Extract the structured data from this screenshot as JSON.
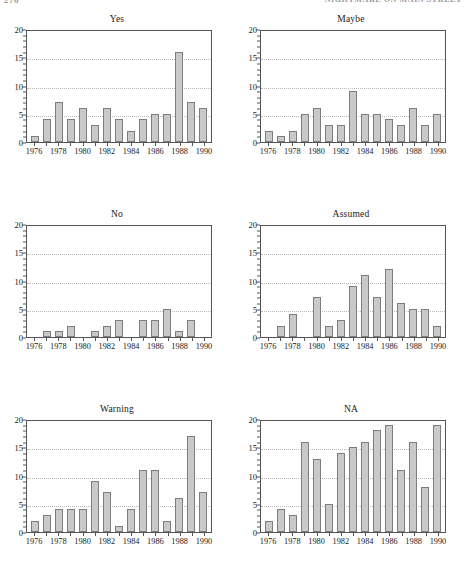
{
  "running_head": {
    "folio": "276",
    "title": "NIGHTMARE ON MAIN STREET"
  },
  "colors": {
    "bar_fill": "#c9c9c9",
    "bar_border": "#7d7d7d",
    "axis": "#555555",
    "gridline": "#b9b9b9",
    "text": "#1a1a1a"
  },
  "chart_data": [
    {
      "type": "bar",
      "title": "Yes",
      "xlabel": "",
      "ylabel": "",
      "x": [
        1976,
        1977,
        1978,
        1979,
        1980,
        1981,
        1982,
        1983,
        1984,
        1985,
        1986,
        1987,
        1988,
        1989,
        1990
      ],
      "values": [
        1,
        4,
        7,
        4,
        6,
        3,
        6,
        4,
        2,
        4,
        5,
        5,
        16,
        7,
        6
      ],
      "ylim": [
        0,
        20
      ],
      "yticks": [
        0,
        5,
        10,
        15,
        20
      ],
      "ytick_labels": [
        "0",
        "5",
        "10",
        "15",
        "20"
      ],
      "yminor_step": 1,
      "xtick_labels": [
        "1976",
        "1978",
        "1980",
        "1982",
        "1984",
        "1986",
        "1988",
        "1990"
      ],
      "xtick_years": [
        1976,
        1978,
        1980,
        1982,
        1984,
        1986,
        1988,
        1990
      ],
      "gridlines": [
        5,
        10,
        15
      ],
      "grid": true,
      "legend": "none"
    },
    {
      "type": "bar",
      "title": "Maybe",
      "xlabel": "",
      "ylabel": "",
      "x": [
        1976,
        1977,
        1978,
        1979,
        1980,
        1981,
        1982,
        1983,
        1984,
        1985,
        1986,
        1987,
        1988,
        1989,
        1990
      ],
      "values": [
        2,
        1,
        2,
        5,
        6,
        3,
        3,
        9,
        5,
        5,
        4,
        3,
        6,
        3,
        5
      ],
      "ylim": [
        0,
        20
      ],
      "yticks": [
        0,
        5,
        10,
        15,
        20
      ],
      "ytick_labels": [
        "0",
        "5",
        "10",
        "15",
        "20"
      ],
      "yminor_step": 1,
      "xtick_labels": [
        "1976",
        "1978",
        "1980",
        "1982",
        "1984",
        "1986",
        "1988",
        "1990"
      ],
      "xtick_years": [
        1976,
        1978,
        1980,
        1982,
        1984,
        1986,
        1988,
        1990
      ],
      "gridlines": [
        5,
        10,
        15
      ],
      "grid": true,
      "legend": "none"
    },
    {
      "type": "bar",
      "title": "No",
      "xlabel": "",
      "ylabel": "",
      "x": [
        1976,
        1977,
        1978,
        1979,
        1980,
        1981,
        1982,
        1983,
        1984,
        1985,
        1986,
        1987,
        1988,
        1989,
        1990
      ],
      "values": [
        0,
        1,
        1,
        2,
        0,
        1,
        2,
        3,
        0,
        3,
        3,
        5,
        1,
        3,
        0
      ],
      "ylim": [
        0,
        20
      ],
      "yticks": [
        0,
        5,
        10,
        15,
        20
      ],
      "ytick_labels": [
        "0",
        "5",
        "10",
        "15",
        "20"
      ],
      "yminor_step": 1,
      "xtick_labels": [
        "1976",
        "1978",
        "1980",
        "1982",
        "1984",
        "1986",
        "1988",
        "1990"
      ],
      "xtick_years": [
        1976,
        1978,
        1980,
        1982,
        1984,
        1986,
        1988,
        1990
      ],
      "gridlines": [
        5,
        10,
        15
      ],
      "grid": true,
      "legend": "none"
    },
    {
      "type": "bar",
      "title": "Assumed",
      "xlabel": "",
      "ylabel": "",
      "x": [
        1976,
        1977,
        1978,
        1979,
        1980,
        1981,
        1982,
        1983,
        1984,
        1985,
        1986,
        1987,
        1988,
        1989,
        1990
      ],
      "values": [
        0,
        2,
        4,
        0,
        7,
        2,
        3,
        9,
        11,
        7,
        12,
        6,
        5,
        5,
        2
      ],
      "ylim": [
        0,
        20
      ],
      "yticks": [
        0,
        5,
        10,
        15,
        20
      ],
      "ytick_labels": [
        "0",
        "5",
        "10",
        "15",
        "20"
      ],
      "yminor_step": 1,
      "xtick_labels": [
        "1976",
        "1978",
        "1980",
        "1982",
        "1984",
        "1986",
        "1988",
        "1990"
      ],
      "xtick_years": [
        1976,
        1978,
        1980,
        1982,
        1984,
        1986,
        1988,
        1990
      ],
      "gridlines": [
        5,
        10,
        15
      ],
      "grid": true,
      "legend": "none"
    },
    {
      "type": "bar",
      "title": "Warning",
      "xlabel": "",
      "ylabel": "",
      "x": [
        1976,
        1977,
        1978,
        1979,
        1980,
        1981,
        1982,
        1983,
        1984,
        1985,
        1986,
        1987,
        1988,
        1989,
        1990
      ],
      "values": [
        2,
        3,
        4,
        4,
        4,
        9,
        7,
        1,
        4,
        11,
        11,
        2,
        6,
        17,
        7
      ],
      "ylim": [
        0,
        20
      ],
      "yticks": [
        0,
        5,
        10,
        15,
        20
      ],
      "ytick_labels": [
        "0",
        "5",
        "10",
        "15",
        "20"
      ],
      "yminor_step": 1,
      "xtick_labels": [
        "1976",
        "1978",
        "1980",
        "1982",
        "1984",
        "1986",
        "1988",
        "1990"
      ],
      "xtick_years": [
        1976,
        1978,
        1980,
        1982,
        1984,
        1986,
        1988,
        1990
      ],
      "gridlines": [
        5,
        10,
        15
      ],
      "grid": true,
      "legend": "none"
    },
    {
      "type": "bar",
      "title": "NA",
      "xlabel": "",
      "ylabel": "",
      "x": [
        1976,
        1977,
        1978,
        1979,
        1980,
        1981,
        1982,
        1983,
        1984,
        1985,
        1986,
        1987,
        1988,
        1989,
        1990
      ],
      "values": [
        2,
        4,
        3,
        16,
        13,
        5,
        14,
        15,
        16,
        18,
        19,
        11,
        16,
        8,
        19
      ],
      "ylim": [
        0,
        20
      ],
      "yticks": [
        0,
        5,
        10,
        15,
        20
      ],
      "ytick_labels": [
        "0",
        "5",
        "10",
        "15",
        "20"
      ],
      "yminor_step": 1,
      "xtick_labels": [
        "1976",
        "1978",
        "1980",
        "1982",
        "1984",
        "1986",
        "1988",
        "1990"
      ],
      "xtick_years": [
        1976,
        1978,
        1980,
        1982,
        1984,
        1986,
        1988,
        1990
      ],
      "gridlines": [
        5,
        10,
        15
      ],
      "grid": true,
      "legend": "none"
    }
  ]
}
